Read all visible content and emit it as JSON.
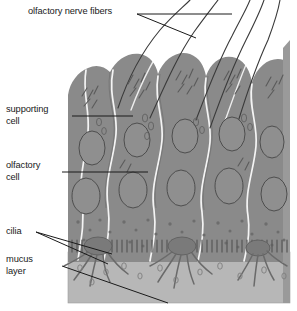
{
  "figure": {
    "labels": {
      "nerve_fibers": "olfactory nerve fibers",
      "supporting_cell": "supporting\ncell",
      "olfactory_cell": "olfactory\ncell",
      "cilia": "cilia",
      "mucus_layer": "mucus\nlayer"
    },
    "colors": {
      "background": "#ffffff",
      "cell_body": "#8a8a8a",
      "cell_body_dark": "#7d7d7d",
      "mucus": "#b7b7b7",
      "nucleus_outline": "#4a4a4a",
      "cell_outline": "#f2f2f2",
      "leader_line": "#1a1a1a",
      "text": "#1a1a1a",
      "organelle": "#5e5e5e"
    },
    "structures": [
      "olfactory nerve fibers",
      "supporting cell",
      "olfactory cell",
      "cilia",
      "mucus layer"
    ]
  }
}
